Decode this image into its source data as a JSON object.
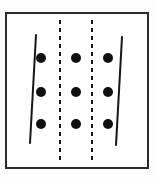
{
  "figure": {
    "title": "Grid of nine dots with two slanted solid lines and two vertical dashed lines",
    "canvas": {
      "width": 158,
      "height": 183
    },
    "background_color": "#fdfdfd",
    "ink_color": "#1a1a1a"
  },
  "frame": {
    "name": "outer rectangle border",
    "x": 6,
    "y": 13,
    "width": 142,
    "height": 155,
    "stroke_width": 2,
    "stroke_color": "#2b2b2b",
    "fill_color": "#ffffff"
  },
  "dots": {
    "label": "nine black filled dots arranged in a 3 by 3 grid",
    "radius": 5,
    "color": "#101010",
    "columns_x": [
      41,
      76,
      108
    ],
    "rows_y": [
      58,
      92,
      124
    ],
    "points": [
      {
        "id": "dot-r1-c1",
        "x": 41,
        "y": 58
      },
      {
        "id": "dot-r1-c2",
        "x": 76,
        "y": 58
      },
      {
        "id": "dot-r1-c3",
        "x": 108,
        "y": 58
      },
      {
        "id": "dot-r2-c1",
        "x": 41,
        "y": 92
      },
      {
        "id": "dot-r2-c2",
        "x": 76,
        "y": 92
      },
      {
        "id": "dot-r2-c3",
        "x": 108,
        "y": 92
      },
      {
        "id": "dot-r3-c1",
        "x": 41,
        "y": 124
      },
      {
        "id": "dot-r3-c2",
        "x": 76,
        "y": 124
      },
      {
        "id": "dot-r3-c3",
        "x": 108,
        "y": 124
      }
    ]
  },
  "solid_lines": [
    {
      "id": "left-slanted-line",
      "label": "left slanted solid line",
      "x1": 36,
      "y1": 35,
      "x2": 30,
      "y2": 143,
      "stroke_width": 2,
      "stroke_color": "#161616"
    },
    {
      "id": "right-slanted-line",
      "label": "right slanted solid line",
      "x1": 122,
      "y1": 37,
      "x2": 116,
      "y2": 145,
      "stroke_width": 2,
      "stroke_color": "#161616"
    }
  ],
  "dashed_lines": [
    {
      "id": "left-dashed-line",
      "label": "first vertical dashed line",
      "x1": 60,
      "y1": 20,
      "x2": 60,
      "y2": 163,
      "stroke_width": 2,
      "stroke_color": "#161616",
      "dash_pattern": "4 4"
    },
    {
      "id": "right-dashed-line",
      "label": "second vertical dashed line",
      "x1": 92,
      "y1": 20,
      "x2": 92,
      "y2": 163,
      "stroke_width": 2,
      "stroke_color": "#161616",
      "dash_pattern": "4 4"
    }
  ]
}
